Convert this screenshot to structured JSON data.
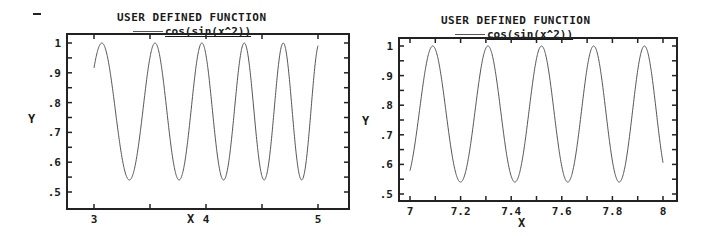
{
  "chart_data": [
    {
      "type": "line",
      "title": "USER DEFINED FUNCTION",
      "legend": [
        "cos(sin(x^2))"
      ],
      "xlabel": "X",
      "ylabel": "Y",
      "function": "cos(sin(x^2))",
      "x_domain": [
        3,
        5
      ],
      "xlim": [
        2.76,
        5.27
      ],
      "ylim": [
        0.5,
        1.0
      ],
      "xticks": [
        3,
        4,
        5
      ],
      "xtick_labels": [
        "3",
        "4",
        "5"
      ],
      "xminor": [
        3.5,
        4.5
      ],
      "yticks": [
        0.5,
        0.6,
        0.7,
        0.8,
        0.9,
        1.0
      ],
      "ytick_labels": [
        ".5",
        ".6",
        ".7",
        ".8",
        ".9",
        "1"
      ],
      "series": [
        {
          "name": "cos(sin(x^2))",
          "y_min": 0.5403,
          "y_max": 1.0,
          "minima_x": [
            3.3,
            3.75,
            4.15,
            4.53,
            4.86
          ],
          "maxima_x": [
            3.07,
            3.54,
            3.96,
            4.34,
            4.69
          ]
        }
      ],
      "grid": false,
      "legend_position": "top-center"
    },
    {
      "type": "line",
      "title": "USER DEFINED FUNCTION",
      "legend": [
        "cos(sin(x^2))"
      ],
      "xlabel": "X",
      "ylabel": "Y",
      "function": "cos(sin(x^2))",
      "x_domain": [
        7,
        8
      ],
      "xlim": [
        6.957,
        8.05
      ],
      "ylim": [
        0.5,
        1.0
      ],
      "xticks": [
        7,
        7.2,
        7.4,
        7.6,
        7.8,
        8
      ],
      "xtick_labels": [
        "7",
        "7.2",
        "7.4",
        "7.6",
        "7.8",
        "8"
      ],
      "xminor": [
        7.1,
        7.3,
        7.5,
        7.7,
        7.9
      ],
      "yticks": [
        0.5,
        0.6,
        0.7,
        0.8,
        0.9,
        1.0
      ],
      "ytick_labels": [
        ".5",
        ".6",
        ".7",
        ".8",
        ".9",
        "1"
      ],
      "series": [
        {
          "name": "cos(sin(x^2))",
          "y_min": 0.5403,
          "y_max": 1.0,
          "minima_x": [
            7.2,
            7.42,
            7.63,
            7.83
          ],
          "maxima_x": [
            7.09,
            7.31,
            7.53,
            7.73,
            7.93
          ]
        }
      ],
      "grid": false,
      "legend_position": "top-center"
    }
  ],
  "panels": [
    {
      "title": "USER DEFINED FUNCTION",
      "legend_label": "cos(sin(x^2))",
      "xlabel": "X",
      "ylabel": "Y",
      "frame": {
        "left": 67,
        "top": 34,
        "right": 349,
        "bottom": 209
      },
      "px": {
        "x0": 94,
        "x1": 318,
        "xv0": 3,
        "xv1": 5,
        "y0": 43,
        "y1": 192,
        "yv0": 1.0,
        "yv1": 0.5
      }
    },
    {
      "title": "USER DEFINED FUNCTION",
      "legend_label": "cos(sin(x^2))",
      "xlabel": "X",
      "ylabel": "Y",
      "frame": {
        "left": 399,
        "top": 38,
        "right": 677,
        "bottom": 201
      },
      "px": {
        "x0": 410,
        "x1": 663,
        "xv0": 7,
        "xv1": 8,
        "y0": 46,
        "y1": 194,
        "yv0": 1.0,
        "yv1": 0.5
      }
    }
  ],
  "colors": {
    "curve": "#555555",
    "frame": "#222222",
    "text": "#1a1a1a"
  }
}
